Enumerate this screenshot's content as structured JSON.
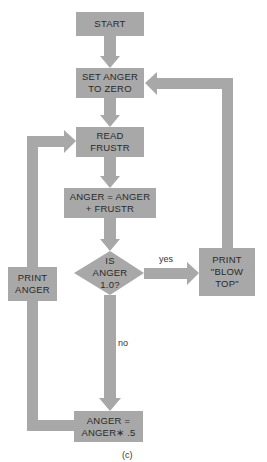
{
  "colors": {
    "fill": "#a8a8a8",
    "text": "#2a2a2a",
    "background": "#ffffff"
  },
  "nodes": {
    "start": "START",
    "set_anger": "SET ANGER\nTO ZERO",
    "read_frustr": "READ\nFRUSTR",
    "add": "ANGER = ANGER\n+ FRUSTR",
    "decision": "IS\nANGER\n1.0?",
    "print_blow_top": "PRINT\n\"BLOW\nTOP\"",
    "print_anger": "PRINT\nANGER",
    "halve": "ANGER =\nANGER∗ .5"
  },
  "edges": {
    "yes": "yes",
    "no": "no"
  },
  "caption": "(c)"
}
